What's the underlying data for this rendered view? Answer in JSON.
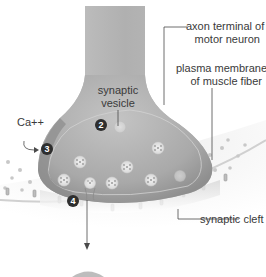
{
  "diagram": {
    "labels": {
      "axon_terminal_line1": "axon terminal of",
      "axon_terminal_line2": "motor neuron",
      "plasma_membrane_line1": "plasma membrane",
      "plasma_membrane_line2": "of muscle fiber",
      "synaptic_vesicle_line1": "synaptic",
      "synaptic_vesicle_line2": "vesicle",
      "calcium": "Ca++",
      "synaptic_cleft": "synaptic cleft"
    },
    "markers": [
      "2",
      "3",
      "4"
    ],
    "colors": {
      "terminal_fill": "#b5b5b5",
      "terminal_shadow": "#8f8f8f",
      "vesicle": "#e6e6e6",
      "marker": "#2e2e2e",
      "leader_line": "#4a4a4a",
      "text": "#3a3a3a"
    }
  }
}
